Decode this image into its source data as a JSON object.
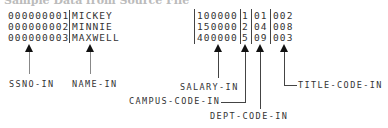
{
  "heading": "Sample Data from Source File",
  "records_left": [
    {
      "ssno": "000000001",
      "name": "MICKEY"
    },
    {
      "ssno": "000000002",
      "name": "MINNIE"
    },
    {
      "ssno": "000000003",
      "name": "MAXWELL"
    }
  ],
  "records_right": [
    {
      "salary": "100000",
      "campus": "1",
      "dept": "01",
      "title": "002"
    },
    {
      "salary": "150000",
      "campus": "2",
      "dept": "04",
      "title": "008"
    },
    {
      "salary": "400000",
      "campus": "5",
      "dept": "09",
      "title": "003"
    }
  ],
  "labels": {
    "ssno": "SSNO-IN",
    "name": "NAME-IN",
    "salary": "SALARY-IN",
    "campus": "CAMPUS-CODE-IN",
    "dept": "DEPT-CODE-IN",
    "title": "TITLE-CODE-IN"
  }
}
